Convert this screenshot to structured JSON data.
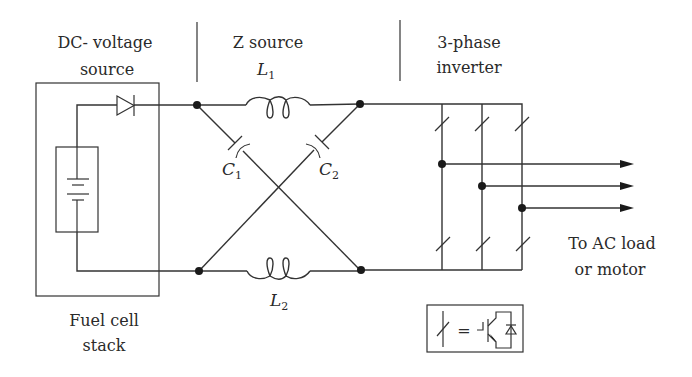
{
  "diagram": {
    "sections": {
      "dc_source": {
        "line1": "DC- voltage",
        "line2": "source"
      },
      "z_source": {
        "label": "Z source"
      },
      "inverter": {
        "line1": "3-phase",
        "line2": "inverter"
      }
    },
    "components": {
      "L1": {
        "letter": "L",
        "sub": "1"
      },
      "L2": {
        "letter": "L",
        "sub": "2"
      },
      "C1": {
        "letter": "C",
        "sub": "1"
      },
      "C2": {
        "letter": "C",
        "sub": "2"
      }
    },
    "fuel_cell": {
      "line1": "Fuel cell",
      "line2": "stack"
    },
    "output": {
      "line1": "To AC load",
      "line2": "or motor"
    },
    "legend": {
      "equals": "="
    },
    "colors": {
      "line": "#333333",
      "background": "#ffffff"
    }
  }
}
